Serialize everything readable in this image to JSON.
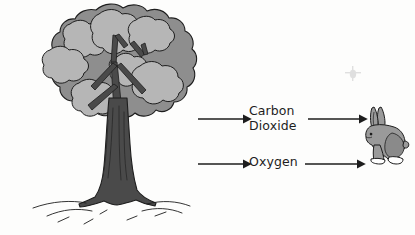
{
  "diagram": {
    "background_color": "#fdfdfc",
    "ink_color": "#1d1d1d",
    "organisms": [
      {
        "name": "tree",
        "side": "left",
        "description": "Broadleaf tree with rounded cloud-like canopy and thick trunk",
        "canopy_base_color": "#8e8e8e",
        "canopy_cluster_color": "#b6b6b6",
        "trunk_color": "#4a4a4a",
        "outline_color": "#1d1d1d"
      },
      {
        "name": "rabbit",
        "side": "right",
        "description": "Gray hare sitting upright facing left with long ears",
        "body_color": "#9a9a9a",
        "shade_color": "#7c7c7c",
        "outline_color": "#1d1d1d"
      }
    ],
    "ground": {
      "name": "ground-line",
      "description": "Wavy ground lines with short grass strokes under the tree"
    },
    "flows": [
      {
        "id": "carbon-dioxide",
        "label_lines": [
          "Carbon",
          "Dioxide"
        ],
        "label_text": "Carbon Dioxide",
        "direction": "right-to-left",
        "from": "rabbit",
        "to": "tree",
        "arrow_glyph": "left-arrow",
        "row": "top"
      },
      {
        "id": "oxygen",
        "label_lines": [
          "Oxygen"
        ],
        "label_text": "Oxygen",
        "direction": "left-to-right",
        "from": "tree",
        "to": "rabbit",
        "arrow_glyph": "right-arrow",
        "row": "bottom"
      }
    ],
    "artifact": {
      "name": "scan-smudge",
      "description": "Faint gray scanning smudge in the upper right area"
    }
  }
}
